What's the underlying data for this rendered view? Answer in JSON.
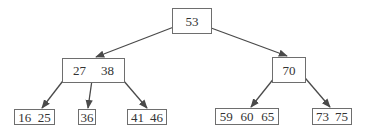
{
  "diagram": {
    "type": "b-tree",
    "colors": {
      "stroke": "#4a4a4a",
      "border": "#6e6e6e",
      "text": "#333333",
      "background": "#ffffff"
    },
    "nodes": {
      "root": {
        "keys": [
          "53"
        ]
      },
      "left": {
        "keys": [
          "27",
          "38"
        ]
      },
      "right": {
        "keys": [
          "70"
        ]
      },
      "leaf1": {
        "keys": [
          "16",
          "25"
        ]
      },
      "leaf2": {
        "keys": [
          "36"
        ]
      },
      "leaf3": {
        "keys": [
          "41",
          "46"
        ]
      },
      "leaf4": {
        "keys": [
          "59",
          "60",
          "65"
        ]
      },
      "leaf5": {
        "keys": [
          "73",
          "75"
        ]
      }
    },
    "edges": [
      {
        "from": "root",
        "to": "left"
      },
      {
        "from": "root",
        "to": "right"
      },
      {
        "from": "left",
        "to": "leaf1"
      },
      {
        "from": "left",
        "to": "leaf2"
      },
      {
        "from": "left",
        "to": "leaf3"
      },
      {
        "from": "right",
        "to": "leaf4"
      },
      {
        "from": "right",
        "to": "leaf5"
      }
    ]
  }
}
